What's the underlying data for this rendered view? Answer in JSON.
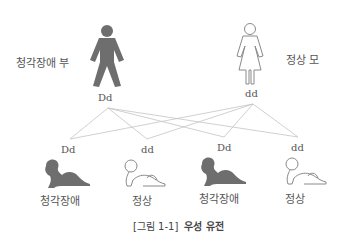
{
  "parents": {
    "father": {
      "label": "청각장애 부",
      "genotype": "Dd",
      "phenotype": "affected"
    },
    "mother": {
      "label": "정상 모",
      "genotype": "dd",
      "phenotype": "normal"
    }
  },
  "children": [
    {
      "genotype": "Dd",
      "label": "청각장애",
      "phenotype": "affected"
    },
    {
      "genotype": "dd",
      "label": "정상",
      "phenotype": "normal"
    },
    {
      "genotype": "Dd",
      "label": "청각장애",
      "phenotype": "affected"
    },
    {
      "genotype": "dd",
      "label": "정상",
      "phenotype": "normal"
    }
  ],
  "caption": {
    "number": "[그림 1-1]",
    "title": "우성 유전"
  },
  "colors": {
    "affected": "#6e6e6e",
    "normal_outline": "#8a8a8a",
    "lines": "#bdbdbd"
  }
}
